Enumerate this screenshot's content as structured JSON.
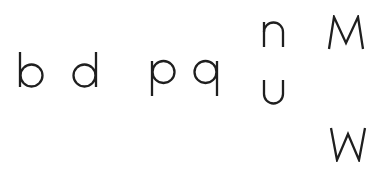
{
  "letters": [
    {
      "char": "b",
      "x": 19,
      "y": 52
    },
    {
      "char": "d",
      "x": 72,
      "y": 52
    },
    {
      "char": "p",
      "x": 151,
      "y": 60
    },
    {
      "char": "q",
      "x": 193,
      "y": 60
    },
    {
      "char": "n",
      "x": 263,
      "y": 22
    },
    {
      "char": "u",
      "x": 263,
      "y": 80
    },
    {
      "char": "M",
      "x": 328,
      "y": 16
    },
    {
      "char": "W",
      "x": 330,
      "y": 127
    }
  ],
  "colors": {
    "ink": "#1f1f1f",
    "background": "#ffffff"
  }
}
